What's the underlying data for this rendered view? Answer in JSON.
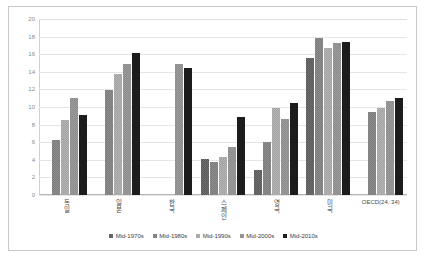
{
  "chart_data": {
    "type": "bar",
    "title": "",
    "xlabel": "",
    "ylabel": "",
    "ylim": [
      0,
      20
    ],
    "ytick_step": 2,
    "yticks": [
      "0",
      "2",
      "4",
      "6",
      "8",
      "10",
      "12",
      "14",
      "16",
      "18",
      "20"
    ],
    "grid": true,
    "legend_position": "bottom",
    "categories": [
      "독일",
      "일본",
      "한국",
      "스페인",
      "영국",
      "미국",
      "OECD(24, 34)"
    ],
    "series": [
      {
        "name": "Mid-1970s",
        "color": "#595959",
        "values": [
          null,
          null,
          null,
          4.1,
          2.8,
          15.6,
          null
        ]
      },
      {
        "name": "Mid-1980s",
        "color": "#7b7b7b",
        "values": [
          6.2,
          11.9,
          null,
          3.8,
          6.0,
          17.8,
          9.4
        ]
      },
      {
        "name": "Mid-1990s",
        "color": "#a3a3a3",
        "values": [
          8.5,
          13.7,
          null,
          4.3,
          9.9,
          16.7,
          9.9
        ]
      },
      {
        "name": "Mid-2000s",
        "color": "#8c8c8c",
        "values": [
          11.0,
          14.9,
          14.9,
          5.4,
          8.6,
          17.3,
          10.7
        ]
      },
      {
        "name": "Mid-2010s",
        "color": "#1c1c1c",
        "values": [
          9.1,
          16.1,
          14.4,
          8.9,
          10.5,
          17.4,
          11.0
        ]
      }
    ]
  }
}
